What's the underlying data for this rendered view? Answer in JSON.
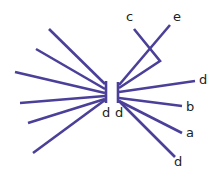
{
  "diagram": {
    "type": "bipartite-fan",
    "line_color": "#4a3f99",
    "label_color": "#222222",
    "left_bar": {
      "x": 106,
      "y1": 81,
      "y2": 103,
      "label": "d"
    },
    "right_bar": {
      "x": 118,
      "y1": 82,
      "y2": 103,
      "label": "d"
    },
    "left_lines": [
      {
        "x1": 49,
        "y1": 29,
        "x2": 105,
        "y2": 84
      },
      {
        "x1": 36,
        "y1": 49,
        "x2": 105,
        "y2": 89
      },
      {
        "x1": 15,
        "y1": 72,
        "x2": 105,
        "y2": 93
      },
      {
        "x1": 20,
        "y1": 103,
        "x2": 105,
        "y2": 96
      },
      {
        "x1": 28,
        "y1": 123,
        "x2": 105,
        "y2": 99
      },
      {
        "x1": 33,
        "y1": 153,
        "x2": 105,
        "y2": 100
      }
    ],
    "right_lines": [
      {
        "id": "e",
        "x1": 119,
        "y1": 85,
        "x2": 170,
        "y2": 25,
        "label": "e",
        "lx": 173,
        "ly": 21
      },
      {
        "id": "d-top",
        "x1": 119,
        "y1": 92,
        "x2": 195,
        "y2": 81,
        "label": "d",
        "lx": 199,
        "ly": 84
      },
      {
        "id": "b",
        "x1": 119,
        "y1": 98,
        "x2": 182,
        "y2": 106,
        "label": "b",
        "lx": 186,
        "ly": 111
      },
      {
        "id": "a",
        "x1": 119,
        "y1": 101,
        "x2": 182,
        "y2": 133,
        "label": "a",
        "lx": 186,
        "ly": 137
      },
      {
        "id": "d-bottom",
        "x1": 119,
        "y1": 101,
        "x2": 175,
        "y2": 157,
        "label": "d",
        "lx": 174,
        "ly": 166
      }
    ],
    "hook_line": {
      "id": "c",
      "points": "134,29 160,61 119,88",
      "label": "c",
      "lx": 126,
      "ly": 21
    }
  }
}
